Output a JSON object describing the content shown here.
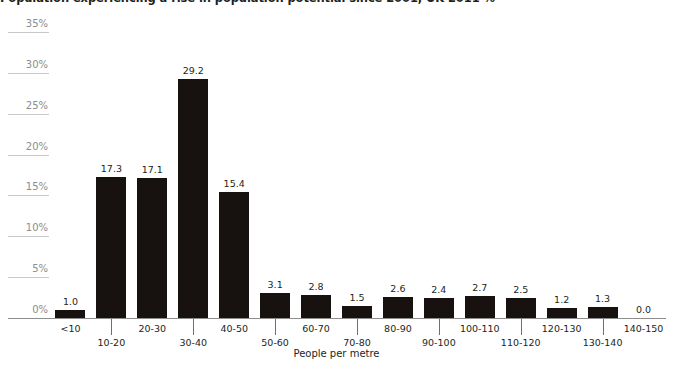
{
  "chart_data": {
    "type": "bar",
    "title": "Population experiencing a rise in population potential since 2001, UK 2011 %",
    "xlabel": "People per metre",
    "ylabel": "",
    "categories": [
      "<10",
      "10-20",
      "20-30",
      "30-40",
      "40-50",
      "50-60",
      "60-70",
      "70-80",
      "80-90",
      "90-100",
      "100-110",
      "110-120",
      "120-130",
      "130-140",
      "140-150"
    ],
    "values": [
      1.0,
      17.3,
      17.1,
      29.2,
      15.4,
      3.1,
      2.8,
      1.5,
      2.6,
      2.4,
      2.7,
      2.5,
      1.2,
      1.3,
      0.0
    ],
    "value_labels": [
      "1.0",
      "17.3",
      "17.1",
      "29.2",
      "15.4",
      "3.1",
      "2.8",
      "1.5",
      "2.6",
      "2.4",
      "2.7",
      "2.5",
      "1.2",
      "1.3",
      "0.0"
    ],
    "ylim": [
      0,
      35
    ],
    "yticks": [
      0,
      5,
      10,
      15,
      20,
      25,
      30,
      35
    ],
    "ytick_labels": [
      "0%",
      "5%",
      "10%",
      "15%",
      "20%",
      "25%",
      "30%",
      "35%"
    ],
    "grid": "y-label-stubs-only",
    "legend": "none",
    "bar_color": "#17120f",
    "axis_color": "#8d8d8d",
    "grid_color": "#c9c9c9",
    "text_color": "#231f20"
  }
}
